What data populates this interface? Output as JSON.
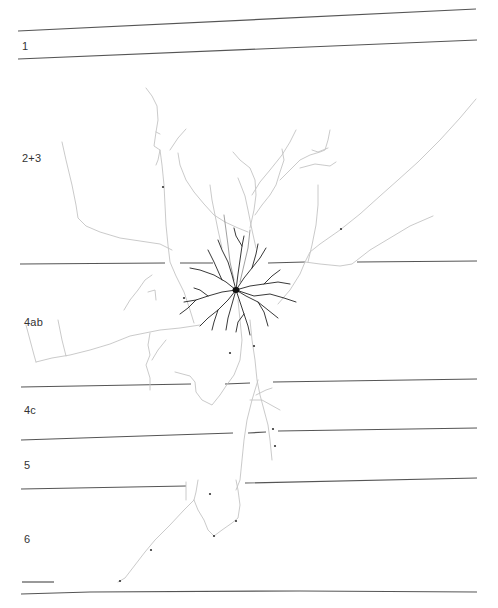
{
  "figure": {
    "type": "neuron-reconstruction",
    "layers": [
      {
        "label": "1",
        "label_x": 22,
        "label_y": 40
      },
      {
        "label": "2+3",
        "label_x": 22,
        "label_y": 152
      },
      {
        "label": "4ab",
        "label_x": 24,
        "label_y": 316
      },
      {
        "label": "4c",
        "label_x": 24,
        "label_y": 404
      },
      {
        "label": "5",
        "label_x": 24,
        "label_y": 459
      },
      {
        "label": "6",
        "label_x": 24,
        "label_y": 533
      }
    ],
    "scale_bar": {
      "x1": 22,
      "x2": 54,
      "y": 582
    },
    "colors": {
      "boundary": "#555555",
      "axon": "#c4c4c4",
      "dendrite": "#222222",
      "background": "#ffffff"
    }
  }
}
